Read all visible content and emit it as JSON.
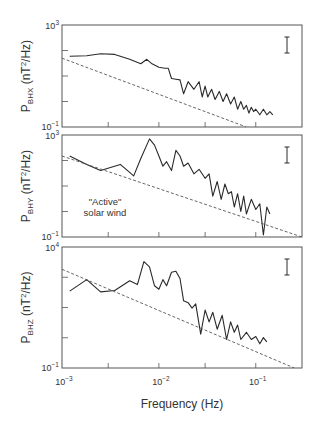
{
  "figure": {
    "xlabel": "Frequency (Hz)",
    "annotation": "\"Active\"\nsolar wind",
    "colors": {
      "line": "#2a2a2a",
      "frame": "#555555",
      "dashed": "#555555",
      "text": "#333333"
    }
  },
  "chart_data": [
    {
      "type": "line",
      "panel": 1,
      "ylabel": "P_BHX (nT2/Hz)",
      "ylabel_main": "P",
      "ylabel_sub": "BHX",
      "ylabel_unit": " (nT2/Hz)",
      "xscale": "log",
      "yscale": "log",
      "xlim": [
        0.001,
        0.3
      ],
      "ylim": [
        0.1,
        1000
      ],
      "ytick_labels": [
        "10^3",
        "10^-1"
      ],
      "xtick_labels": [],
      "error_bar": true,
      "series": [
        {
          "name": "spectrum",
          "style": "solid",
          "x": [
            0.0012,
            0.0018,
            0.0025,
            0.0035,
            0.005,
            0.0065,
            0.0075,
            0.0085,
            0.01,
            0.0115,
            0.0125,
            0.0135,
            0.015,
            0.0165,
            0.018,
            0.02,
            0.023,
            0.026,
            0.028,
            0.03,
            0.032,
            0.035,
            0.038,
            0.042,
            0.046,
            0.05,
            0.055,
            0.06,
            0.065,
            0.07,
            0.075,
            0.08,
            0.085,
            0.09,
            0.095,
            0.1,
            0.11,
            0.12,
            0.13,
            0.14,
            0.15
          ],
          "y": [
            60,
            62,
            75,
            70,
            45,
            30,
            45,
            30,
            22,
            20,
            20,
            8,
            7.5,
            7,
            2,
            6,
            3,
            6,
            1.5,
            4,
            1.5,
            3,
            1.2,
            2.5,
            1.0,
            2.0,
            0.8,
            1.5,
            0.5,
            1.0,
            0.5,
            0.7,
            0.35,
            0.6,
            0.4,
            0.5,
            0.3,
            0.5,
            0.3,
            0.4,
            0.3
          ]
        },
        {
          "name": "reference power law",
          "style": "dashed",
          "x": [
            0.001,
            0.08
          ],
          "y": [
            50,
            0.1
          ]
        }
      ]
    },
    {
      "type": "line",
      "panel": 2,
      "ylabel": "P_BHY (nT2/Hz)",
      "ylabel_main": "P",
      "ylabel_sub": "BHY",
      "ylabel_unit": " (nT2/Hz)",
      "xscale": "log",
      "yscale": "log",
      "xlim": [
        0.001,
        0.3
      ],
      "ylim": [
        0.1,
        1000
      ],
      "ytick_labels": [
        "10^3",
        "10^-1"
      ],
      "xtick_labels": [],
      "error_bar": true,
      "annotation": "\"Active\" solar wind",
      "series": [
        {
          "name": "spectrum",
          "style": "solid",
          "x": [
            0.0012,
            0.0018,
            0.0025,
            0.004,
            0.0055,
            0.0065,
            0.008,
            0.009,
            0.01,
            0.011,
            0.012,
            0.0135,
            0.015,
            0.0165,
            0.018,
            0.02,
            0.023,
            0.026,
            0.03,
            0.033,
            0.036,
            0.04,
            0.044,
            0.048,
            0.052,
            0.056,
            0.06,
            0.065,
            0.07,
            0.075,
            0.08,
            0.09,
            0.1,
            0.11,
            0.12,
            0.13,
            0.14
          ],
          "y": [
            150,
            70,
            40,
            70,
            25,
            120,
            700,
            400,
            150,
            60,
            90,
            40,
            250,
            150,
            60,
            80,
            30,
            45,
            20,
            30,
            4,
            15,
            3,
            12,
            5,
            6,
            1.5,
            5,
            1.0,
            4,
            0.8,
            3,
            1.2,
            2.0,
            0.12,
            1.5,
            0.8
          ]
        },
        {
          "name": "reference power law",
          "style": "dashed",
          "x": [
            0.001,
            0.3
          ],
          "y": [
            150,
            0.1
          ]
        }
      ]
    },
    {
      "type": "line",
      "panel": 3,
      "ylabel": "P_BHZ (nT2/Hz)",
      "ylabel_main": "P",
      "ylabel_sub": "BHZ",
      "ylabel_unit": " (nT2/Hz)",
      "xscale": "log",
      "yscale": "log",
      "xlim": [
        0.001,
        0.3
      ],
      "ylim": [
        0.1,
        10000
      ],
      "ytick_labels": [
        "10^4",
        "10^-1"
      ],
      "xtick_labels": [
        "10^-3",
        "10^-2",
        "10^-1"
      ],
      "error_bar": true,
      "series": [
        {
          "name": "spectrum",
          "style": "solid",
          "x": [
            0.0012,
            0.0018,
            0.0025,
            0.0035,
            0.005,
            0.006,
            0.007,
            0.008,
            0.009,
            0.01,
            0.011,
            0.012,
            0.0135,
            0.015,
            0.0165,
            0.018,
            0.02,
            0.022,
            0.024,
            0.027,
            0.03,
            0.033,
            0.036,
            0.04,
            0.045,
            0.05,
            0.055,
            0.06,
            0.065,
            0.07,
            0.08,
            0.09,
            0.1,
            0.11,
            0.12,
            0.13
          ],
          "y": [
            150,
            450,
            140,
            160,
            400,
            280,
            2500,
            1500,
            250,
            180,
            450,
            250,
            900,
            1000,
            500,
            60,
            50,
            30,
            45,
            2.5,
            25,
            8,
            20,
            4,
            15,
            1.5,
            8,
            3,
            6,
            1.5,
            3,
            1.5,
            2,
            1,
            1.8,
            1.2
          ]
        },
        {
          "name": "reference power law",
          "style": "dashed",
          "x": [
            0.001,
            0.25
          ],
          "y": [
            1200,
            0.1
          ]
        }
      ]
    }
  ],
  "axis": {
    "xticks_major": [
      0.001,
      0.01,
      0.1
    ],
    "xticks_minor": [
      0.003,
      0.03
    ]
  }
}
